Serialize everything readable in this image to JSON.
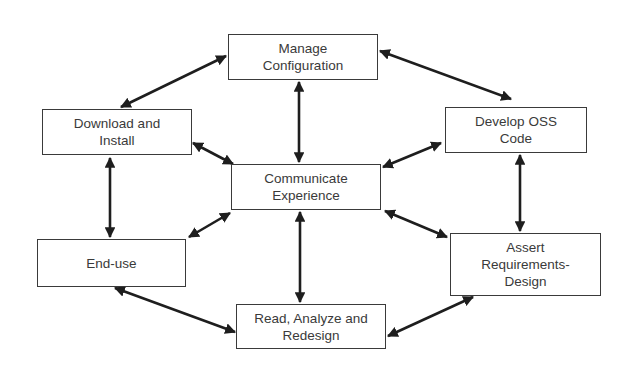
{
  "diagram": {
    "type": "cyclic process flow",
    "nodes": [
      {
        "id": "manage",
        "label": "Manage\nConfiguration",
        "x": 228,
        "y": 34,
        "w": 150,
        "h": 46
      },
      {
        "id": "download",
        "label": "Download and\nInstall",
        "x": 42,
        "y": 109,
        "w": 150,
        "h": 46
      },
      {
        "id": "develop",
        "label": "Develop OSS\nCode",
        "x": 445,
        "y": 107,
        "w": 142,
        "h": 46
      },
      {
        "id": "communicate",
        "label": "Communicate\nExperience",
        "x": 231,
        "y": 164,
        "w": 150,
        "h": 46
      },
      {
        "id": "enduse",
        "label": "End-use",
        "x": 37,
        "y": 239,
        "w": 149,
        "h": 48
      },
      {
        "id": "assert",
        "label": "Assert\nRequirements-\nDesign",
        "x": 450,
        "y": 233,
        "w": 151,
        "h": 63
      },
      {
        "id": "read",
        "label": "Read, Analyze and\nRedesign",
        "x": 236,
        "y": 304,
        "w": 150,
        "h": 45
      }
    ],
    "edges": [
      {
        "from": "manage",
        "to": "download",
        "bidirectional": true
      },
      {
        "from": "manage",
        "to": "develop",
        "bidirectional": true
      },
      {
        "from": "manage",
        "to": "communicate",
        "bidirectional": true
      },
      {
        "from": "download",
        "to": "communicate",
        "bidirectional": true
      },
      {
        "from": "download",
        "to": "enduse",
        "bidirectional": true
      },
      {
        "from": "develop",
        "to": "communicate",
        "bidirectional": true
      },
      {
        "from": "develop",
        "to": "assert",
        "bidirectional": true
      },
      {
        "from": "enduse",
        "to": "communicate",
        "bidirectional": true
      },
      {
        "from": "assert",
        "to": "communicate",
        "bidirectional": true
      },
      {
        "from": "communicate",
        "to": "read",
        "bidirectional": true
      },
      {
        "from": "enduse",
        "to": "read",
        "bidirectional": true
      },
      {
        "from": "assert",
        "to": "read",
        "bidirectional": true
      }
    ]
  },
  "colors": {
    "line": "#1e1e1e",
    "border": "#3a3a3a",
    "text": "#3a3a3a",
    "background": "#ffffff"
  }
}
